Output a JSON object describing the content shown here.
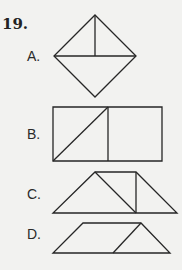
{
  "question": {
    "number": "19.",
    "options": [
      {
        "label": "A.",
        "shape": "diamond divided by horizontal diagonal with vertical segment in upper half"
      },
      {
        "label": "B.",
        "shape": "rectangle split into two squares, left square with diagonal"
      },
      {
        "label": "C.",
        "shape": "trapezoid split by a diagonal and a vertical line"
      },
      {
        "label": "D.",
        "shape": "trapezoid split by one slanted line into parallelogram and triangle"
      }
    ]
  }
}
